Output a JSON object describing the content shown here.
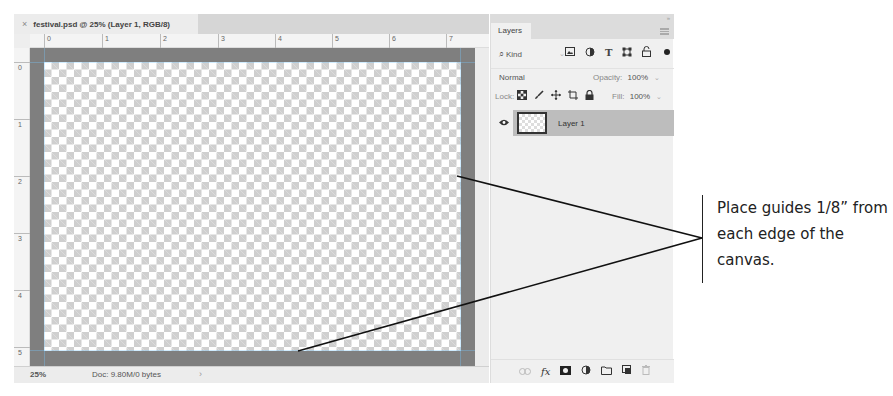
{
  "document": {
    "tab_title": "festival.psd @ 25% (Layer 1, RGB/8)",
    "close_icon": "×",
    "ruler_top_labels": [
      "0",
      "1",
      "2",
      "3",
      "4",
      "5",
      "6",
      "7"
    ],
    "ruler_left_labels": [
      "0",
      "1",
      "2",
      "3",
      "4",
      "5"
    ],
    "status": {
      "zoom": "25%",
      "doc_info": "Doc: 9.80M/0 bytes",
      "arrow": "›"
    }
  },
  "layers_panel": {
    "tab_label": "Layers",
    "collapse": "»",
    "filter": {
      "search_icon": "⌕",
      "kind_label": "Kind",
      "caret": "⌄",
      "filter_icons": [
        "image-filter",
        "adjustment-filter",
        "type-filter",
        "shape-filter",
        "smart-object-filter"
      ]
    },
    "blend_mode": "Normal",
    "blend_caret": "⌄",
    "opacity_label": "Opacity:",
    "opacity_value": "100%",
    "lock_label": "Lock:",
    "fill_label": "Fill:",
    "fill_value": "100%",
    "layers": [
      {
        "name": "Layer 1",
        "visible": true,
        "selected": true
      }
    ],
    "footer_icons": [
      "link-layers",
      "fx",
      "add-mask",
      "adjustment-layer",
      "new-group",
      "new-layer",
      "delete-layer"
    ],
    "fx_label": "fx"
  },
  "callout": {
    "text": "Place guides 1/8” from each edge of the canvas."
  },
  "colors": {
    "pasteboard": "#7f7f7f",
    "selected_layer": "#bdbdbd",
    "panel_bg": "#f0f0f0"
  }
}
